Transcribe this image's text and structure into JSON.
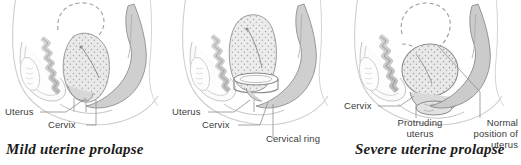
{
  "figure": {
    "background_color": "#ffffff",
    "ink_color": "#6e6e6e",
    "label_color": "#3b3b3b",
    "caption_color": "#1c1c1c"
  },
  "panels": [
    {
      "id": "mild",
      "caption": "Mild uterine prolapse",
      "labels": [
        {
          "name": "uterus",
          "text": "Uterus"
        },
        {
          "name": "cervix",
          "text": "Cervix"
        }
      ]
    },
    {
      "id": "ring",
      "caption": "",
      "labels": [
        {
          "name": "uterus",
          "text": "Uterus"
        },
        {
          "name": "cervix",
          "text": "Cervix"
        },
        {
          "name": "cervical-ring",
          "text": "Cervical ring"
        }
      ]
    },
    {
      "id": "severe",
      "caption": "Severe uterine prolapse",
      "labels": [
        {
          "name": "cervix",
          "text": "Cervix"
        },
        {
          "name": "protruding-uterus",
          "text": "Protruding uterus"
        },
        {
          "name": "normal-position-of-uterus",
          "text": "Normal position of uterus"
        }
      ]
    }
  ]
}
